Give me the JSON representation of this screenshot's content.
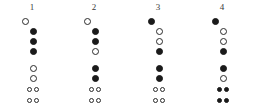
{
  "chart_data": {
    "type": "table",
    "title": "",
    "xlabel": "",
    "ylabel": "",
    "legend": [],
    "row_labels": [
      "thumb",
      "hole-1",
      "hole-2",
      "hole-3",
      "hole-4",
      "hole-5",
      "hole-6",
      "hole-7"
    ],
    "symbols": {
      "filled": "closed",
      "open": "open"
    },
    "columns": [
      {
        "label": "1",
        "holes": [
          {
            "id": "thumb",
            "kind": "thumb",
            "state": "open"
          },
          {
            "id": "hole-1",
            "kind": "single",
            "state": "filled"
          },
          {
            "id": "hole-2",
            "kind": "single",
            "state": "filled"
          },
          {
            "id": "hole-3",
            "kind": "single",
            "state": "filled"
          },
          {
            "id": "hole-4",
            "kind": "single",
            "state": "open"
          },
          {
            "id": "hole-5",
            "kind": "single",
            "state": "open"
          },
          {
            "id": "hole-6",
            "kind": "pair",
            "state": "open",
            "state_right": "open"
          },
          {
            "id": "hole-7",
            "kind": "pair",
            "state": "open",
            "state_right": "open"
          }
        ]
      },
      {
        "label": "2",
        "holes": [
          {
            "id": "thumb",
            "kind": "thumb",
            "state": "open"
          },
          {
            "id": "hole-1",
            "kind": "single",
            "state": "filled"
          },
          {
            "id": "hole-2",
            "kind": "single",
            "state": "filled"
          },
          {
            "id": "hole-3",
            "kind": "single",
            "state": "open"
          },
          {
            "id": "hole-4",
            "kind": "single",
            "state": "filled"
          },
          {
            "id": "hole-5",
            "kind": "single",
            "state": "filled"
          },
          {
            "id": "hole-6",
            "kind": "pair",
            "state": "open",
            "state_right": "open"
          },
          {
            "id": "hole-7",
            "kind": "pair",
            "state": "open",
            "state_right": "open"
          }
        ]
      },
      {
        "label": "3",
        "holes": [
          {
            "id": "thumb",
            "kind": "thumb",
            "state": "filled"
          },
          {
            "id": "hole-1",
            "kind": "single",
            "state": "open"
          },
          {
            "id": "hole-2",
            "kind": "single",
            "state": "open"
          },
          {
            "id": "hole-3",
            "kind": "single",
            "state": "filled"
          },
          {
            "id": "hole-4",
            "kind": "single",
            "state": "filled"
          },
          {
            "id": "hole-5",
            "kind": "single",
            "state": "filled"
          },
          {
            "id": "hole-6",
            "kind": "pair",
            "state": "open",
            "state_right": "open"
          },
          {
            "id": "hole-7",
            "kind": "pair",
            "state": "open",
            "state_right": "open"
          }
        ]
      },
      {
        "label": "4",
        "holes": [
          {
            "id": "thumb",
            "kind": "thumb",
            "state": "filled"
          },
          {
            "id": "hole-1",
            "kind": "single",
            "state": "open"
          },
          {
            "id": "hole-2",
            "kind": "single",
            "state": "open"
          },
          {
            "id": "hole-3",
            "kind": "single",
            "state": "filled"
          },
          {
            "id": "hole-4",
            "kind": "single",
            "state": "filled"
          },
          {
            "id": "hole-5",
            "kind": "single",
            "state": "open"
          },
          {
            "id": "hole-6",
            "kind": "pair",
            "state": "filled",
            "state_right": "filled"
          },
          {
            "id": "hole-7",
            "kind": "pair",
            "state": "filled",
            "state_right": "filled"
          }
        ]
      }
    ],
    "layout": {
      "column_x": [
        0,
        62,
        126,
        190
      ],
      "row_y": [
        0,
        10,
        20,
        30,
        47,
        57,
        68,
        79
      ],
      "colors": {
        "ink": "#1a1a1a",
        "outline": "#2b2b2b",
        "background": "#ffffff",
        "header_text": "#3a3a3a"
      }
    }
  }
}
